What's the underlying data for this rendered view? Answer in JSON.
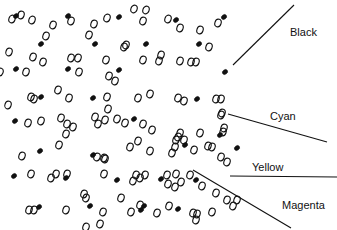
{
  "labels": {
    "black": "Black",
    "cyan": "Cyan",
    "yellow": "Yellow",
    "magenta": "Magenta"
  },
  "colors": {
    "ink": "#111111",
    "background": "#ffffff"
  },
  "dot_types": [
    "open",
    "solid"
  ]
}
